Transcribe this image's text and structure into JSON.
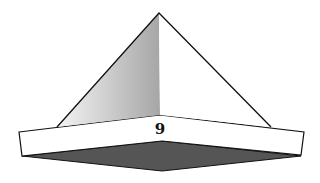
{
  "figure": {
    "label": "9",
    "colors": {
      "background": "#ffffff",
      "outline": "#111111",
      "shaded_face_light": "#f2f2f2",
      "shaded_face_dark": "#a9a9a9",
      "lit_face": "#ffffff",
      "base_band": "#ffffff",
      "underside": "#555555"
    }
  }
}
